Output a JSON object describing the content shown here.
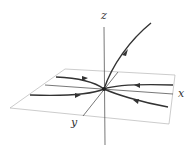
{
  "diagram": {
    "type": "3d-phase-portrait",
    "axes": {
      "x_label": "x",
      "y_label": "y",
      "z_label": "z"
    },
    "colors": {
      "axis": "#444444",
      "plane": "#999999",
      "trajectory": "#333333"
    }
  }
}
